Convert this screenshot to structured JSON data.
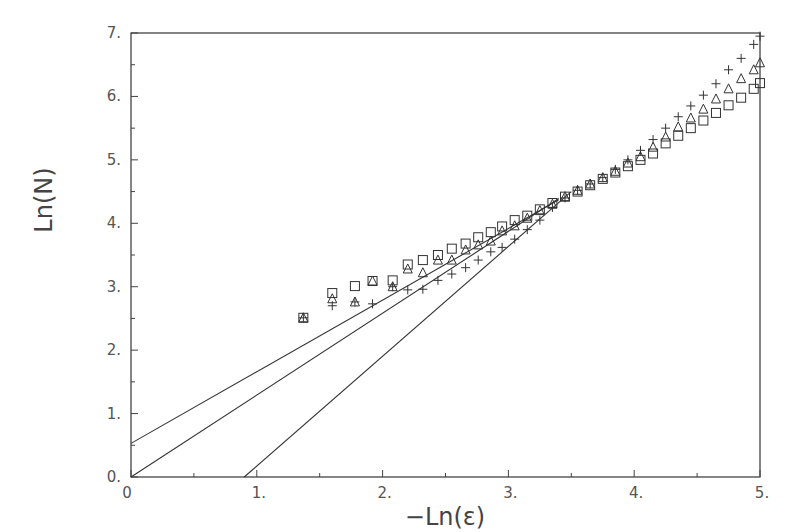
{
  "chart_data": {
    "type": "scatter",
    "title": "",
    "xlabel": "−Ln(ε)",
    "ylabel": "Ln(N)",
    "xlim": [
      0,
      5
    ],
    "ylim": [
      0,
      7
    ],
    "x_ticks": [
      0,
      1,
      2,
      3,
      4,
      5
    ],
    "x_tick_labels": [
      "0",
      "1.",
      "2.",
      "3.",
      "4.",
      "5."
    ],
    "y_ticks": [
      0,
      1,
      2,
      3,
      4,
      5,
      6,
      7
    ],
    "y_tick_labels": [
      "0.",
      "1.",
      "2.",
      "3.",
      "4.",
      "5.",
      "6.",
      "7."
    ],
    "grid": false,
    "legend": null,
    "series": [
      {
        "name": "squares",
        "marker": "square",
        "x": [
          1.37,
          1.6,
          1.78,
          1.92,
          2.08,
          2.2,
          2.32,
          2.44,
          2.55,
          2.66,
          2.76,
          2.86,
          2.95,
          3.05,
          3.15,
          3.25,
          3.35,
          3.45,
          3.55,
          3.65,
          3.75,
          3.85,
          3.95,
          4.05,
          4.15,
          4.25,
          4.35,
          4.45,
          4.55,
          4.65,
          4.75,
          4.85,
          4.95,
          5.0
        ],
        "y": [
          2.51,
          2.9,
          3.01,
          3.09,
          3.1,
          3.35,
          3.42,
          3.5,
          3.6,
          3.68,
          3.78,
          3.86,
          3.95,
          4.05,
          4.12,
          4.22,
          4.32,
          4.42,
          4.5,
          4.6,
          4.7,
          4.8,
          4.9,
          5.0,
          5.1,
          5.26,
          5.38,
          5.5,
          5.62,
          5.74,
          5.86,
          5.98,
          6.12,
          6.21
        ]
      },
      {
        "name": "triangles",
        "marker": "triangle",
        "x": [
          1.37,
          1.6,
          1.78,
          1.92,
          2.08,
          2.2,
          2.32,
          2.44,
          2.55,
          2.66,
          2.76,
          2.86,
          2.95,
          3.05,
          3.15,
          3.25,
          3.35,
          3.45,
          3.55,
          3.65,
          3.75,
          3.85,
          3.95,
          4.05,
          4.15,
          4.25,
          4.35,
          4.45,
          4.55,
          4.65,
          4.75,
          4.85,
          4.95,
          5.0
        ],
        "y": [
          2.51,
          2.81,
          2.76,
          3.09,
          3.0,
          3.28,
          3.22,
          3.42,
          3.42,
          3.58,
          3.66,
          3.72,
          3.88,
          3.96,
          4.08,
          4.2,
          4.3,
          4.42,
          4.52,
          4.62,
          4.72,
          4.82,
          4.95,
          5.05,
          5.2,
          5.36,
          5.52,
          5.66,
          5.8,
          5.96,
          6.12,
          6.28,
          6.42,
          6.53
        ]
      },
      {
        "name": "pluses",
        "marker": "plus",
        "x": [
          1.37,
          1.6,
          1.78,
          1.92,
          2.08,
          2.2,
          2.32,
          2.44,
          2.55,
          2.66,
          2.76,
          2.86,
          2.95,
          3.05,
          3.15,
          3.25,
          3.35,
          3.45,
          3.55,
          3.65,
          3.75,
          3.85,
          3.95,
          4.05,
          4.15,
          4.25,
          4.35,
          4.45,
          4.55,
          4.65,
          4.75,
          4.85,
          4.95,
          5.0
        ],
        "y": [
          2.51,
          2.7,
          2.76,
          2.73,
          3.0,
          2.95,
          2.96,
          3.1,
          3.2,
          3.3,
          3.42,
          3.55,
          3.62,
          3.75,
          3.9,
          4.05,
          4.25,
          4.4,
          4.52,
          4.62,
          4.72,
          4.85,
          5.0,
          5.15,
          5.32,
          5.5,
          5.68,
          5.85,
          6.02,
          6.2,
          6.42,
          6.6,
          6.82,
          6.95
        ]
      }
    ],
    "fit_lines": [
      {
        "name": "fit-line-1",
        "x": [
          0,
          3.4
        ],
        "y": [
          0.53,
          4.37
        ]
      },
      {
        "name": "fit-line-2",
        "x": [
          0,
          3.4
        ],
        "y": [
          0,
          4.39
        ]
      },
      {
        "name": "fit-line-3",
        "x": [
          0.9,
          3.5
        ],
        "y": [
          0,
          4.5
        ]
      }
    ]
  }
}
